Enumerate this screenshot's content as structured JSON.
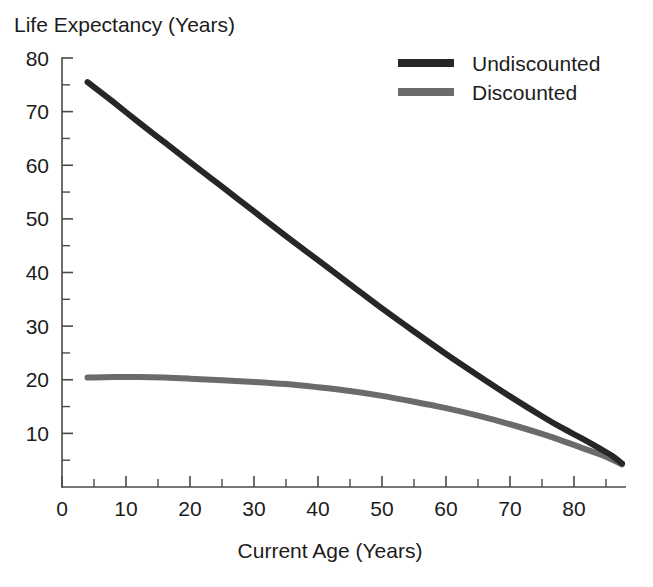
{
  "chart_data": {
    "type": "line",
    "title": "",
    "ylabel": "Life Expectancy (Years)",
    "xlabel": "Current Age (Years)",
    "xlim": [
      0,
      88
    ],
    "ylim": [
      0,
      82
    ],
    "grid": false,
    "legend_position": "top-right",
    "x_ticks_major": [
      0,
      10,
      20,
      30,
      40,
      50,
      60,
      70,
      80
    ],
    "x_ticks_minor": [
      5,
      15,
      25,
      35,
      45,
      55,
      65,
      75,
      85
    ],
    "y_ticks_major": [
      10,
      20,
      30,
      40,
      50,
      60,
      70,
      80
    ],
    "y_ticks_minor": [
      5,
      15,
      25,
      35,
      45,
      55,
      65,
      75
    ],
    "x_tick_labels": [
      "0",
      "10",
      "20",
      "30",
      "40",
      "50",
      "60",
      "70",
      "80"
    ],
    "y_tick_labels": [
      "10",
      "20",
      "30",
      "40",
      "50",
      "60",
      "70",
      "80"
    ],
    "series": [
      {
        "name": "Undiscounted",
        "color": "#262626",
        "width": 6.0,
        "x": [
          4,
          8,
          12,
          16,
          20,
          25,
          30,
          35,
          40,
          45,
          50,
          55,
          60,
          65,
          70,
          75,
          78,
          81,
          84,
          86,
          87.5
        ],
        "values": [
          75.5,
          71.8,
          68.0,
          64.3,
          60.6,
          56.0,
          51.4,
          46.8,
          42.3,
          37.8,
          33.3,
          29.0,
          24.8,
          20.8,
          16.9,
          13.2,
          11.1,
          9.2,
          7.2,
          5.8,
          4.4
        ]
      },
      {
        "name": "Discounted",
        "color": "#6b6b6b",
        "width": 6.0,
        "x": [
          4,
          8,
          12,
          16,
          20,
          25,
          30,
          35,
          40,
          45,
          50,
          55,
          60,
          65,
          70,
          75,
          78,
          81,
          84,
          86,
          87.5
        ],
        "values": [
          20.4,
          20.5,
          20.5,
          20.4,
          20.2,
          19.9,
          19.6,
          19.2,
          18.6,
          17.9,
          17.0,
          15.9,
          14.7,
          13.3,
          11.7,
          9.9,
          8.7,
          7.4,
          6.1,
          5.1,
          4.2
        ]
      }
    ],
    "legend": [
      {
        "label": "Undiscounted",
        "color": "#262626"
      },
      {
        "label": "Discounted",
        "color": "#6b6b6b"
      }
    ]
  },
  "axis_style": {
    "axis_color": "#4a4a4a",
    "text_color": "#1c1c1c",
    "background": "#ffffff"
  }
}
